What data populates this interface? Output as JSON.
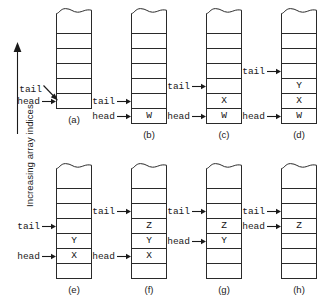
{
  "axis": {
    "label": "Increasing array indices",
    "arrow_icon": "up-arrow-icon",
    "direction": "up"
  },
  "pointer_labels": {
    "head": "head",
    "tail": "tail"
  },
  "diagram": {
    "title": "",
    "cell_count_default": 7,
    "colors": {
      "stroke": "#2a2a2a",
      "text": "#111111",
      "background": "#ffffff"
    }
  },
  "panels": [
    {
      "id": "a",
      "caption": "(a)",
      "cells": [
        "",
        "",
        "",
        "",
        "",
        ""
      ],
      "head_index": 5,
      "tail_index": 5,
      "tail_style": "diagonal",
      "head_style": "horizontal"
    },
    {
      "id": "b",
      "caption": "(b)",
      "cells": [
        "",
        "",
        "",
        "",
        "",
        "",
        "W"
      ],
      "head_index": 6,
      "tail_index": 5,
      "tail_style": "horizontal",
      "head_style": "horizontal"
    },
    {
      "id": "c",
      "caption": "(c)",
      "cells": [
        "",
        "",
        "",
        "",
        "",
        "X",
        "W"
      ],
      "head_index": 6,
      "tail_index": 4,
      "tail_style": "horizontal",
      "head_style": "horizontal"
    },
    {
      "id": "d",
      "caption": "(d)",
      "cells": [
        "",
        "",
        "",
        "",
        "Y",
        "X",
        "W"
      ],
      "head_index": 6,
      "tail_index": 3,
      "tail_style": "horizontal",
      "head_style": "horizontal"
    },
    {
      "id": "e",
      "caption": "(e)",
      "cells": [
        "",
        "",
        "",
        "",
        "Y",
        "X",
        ""
      ],
      "head_index": 5,
      "tail_index": 3,
      "tail_style": "horizontal",
      "head_style": "horizontal"
    },
    {
      "id": "f",
      "caption": "(f)",
      "cells": [
        "",
        "",
        "",
        "Z",
        "Y",
        "X",
        ""
      ],
      "head_index": 5,
      "tail_index": 2,
      "tail_style": "horizontal",
      "head_style": "horizontal"
    },
    {
      "id": "g",
      "caption": "(g)",
      "cells": [
        "",
        "",
        "",
        "Z",
        "Y",
        "",
        ""
      ],
      "head_index": 4,
      "tail_index": 2,
      "tail_style": "horizontal",
      "head_style": "horizontal"
    },
    {
      "id": "h",
      "caption": "(h)",
      "cells": [
        "",
        "",
        "",
        "Z",
        "",
        "",
        ""
      ],
      "head_index": 3,
      "tail_index": 2,
      "tail_style": "horizontal",
      "head_style": "horizontal"
    }
  ],
  "layout": {
    "row_tops": [
      8,
      163
    ],
    "column_lefts": [
      20,
      95,
      170,
      245
    ],
    "cell_height": 15,
    "torn_height": 11
  }
}
